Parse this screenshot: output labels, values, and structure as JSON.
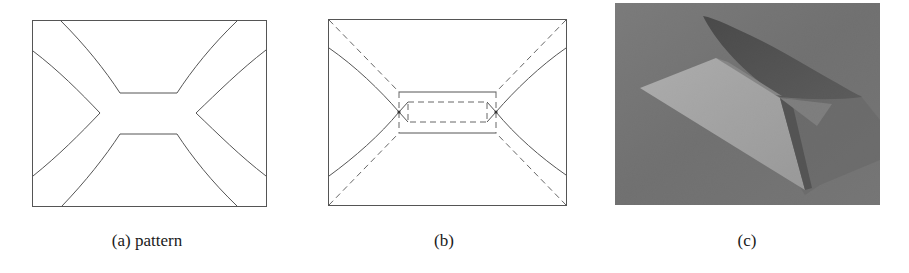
{
  "figure": {
    "panels": [
      {
        "id": "a",
        "caption": "(a) pattern",
        "kind": "cut-pattern"
      },
      {
        "id": "b",
        "caption": "(b)",
        "kind": "crease-pattern"
      },
      {
        "id": "c",
        "caption": "(c)",
        "kind": "photograph-folded-model"
      }
    ],
    "legend": {
      "solid_line": "cut / edge",
      "dashed_line": "fold"
    },
    "colors": {
      "line": "#555555",
      "photo_background": "#707070",
      "photo_lit_face": "#b9b9b9",
      "photo_shadow": "#353535"
    }
  }
}
